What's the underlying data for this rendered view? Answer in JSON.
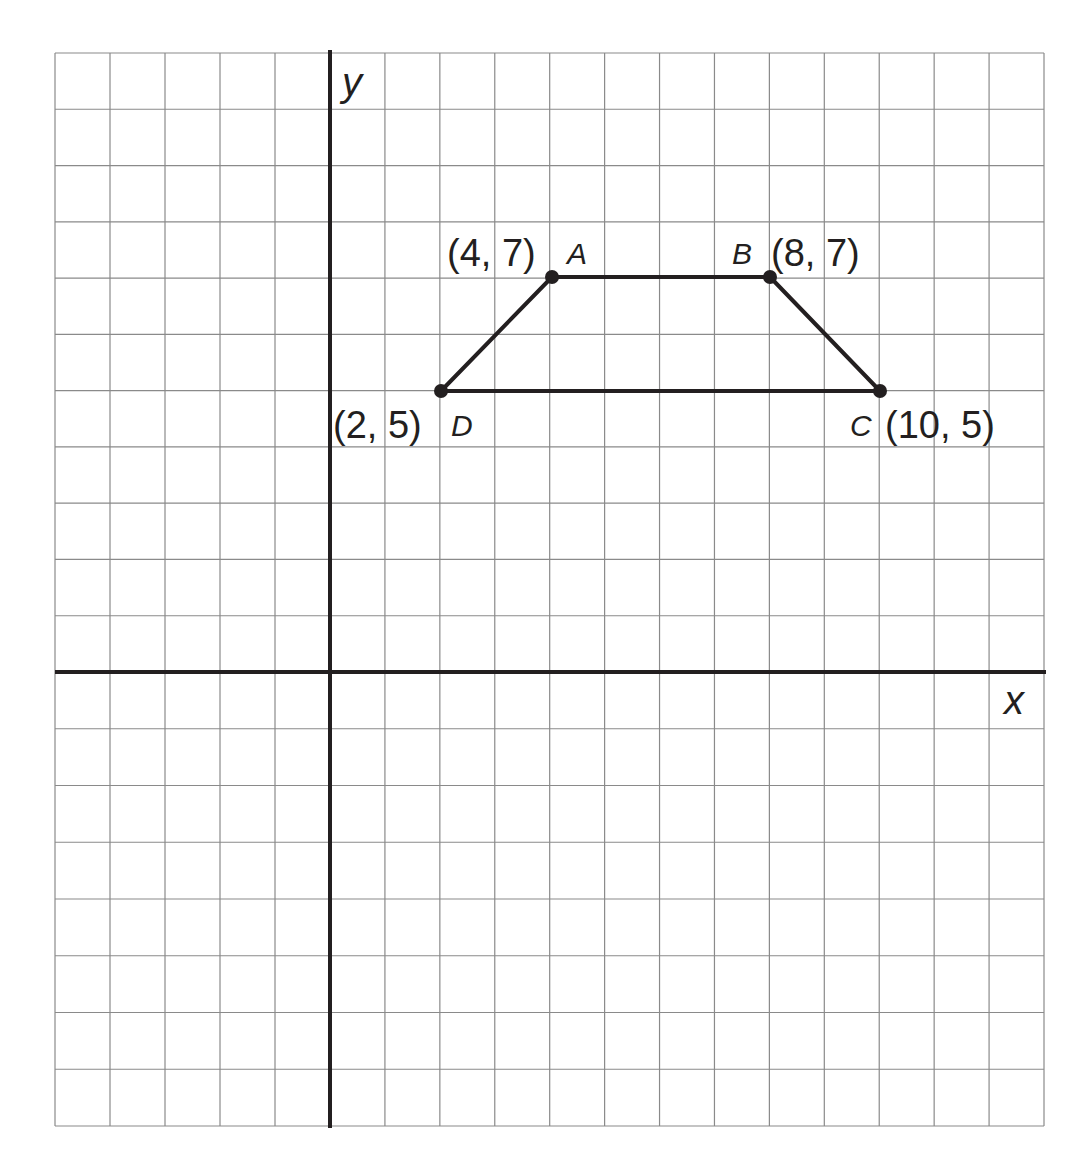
{
  "chart_data": {
    "type": "scatter",
    "title": "",
    "xlabel": "x",
    "ylabel": "y",
    "xlim": [
      -5,
      13
    ],
    "ylim": [
      -8,
      11
    ],
    "grid": true,
    "points": [
      {
        "name": "A",
        "x": 4,
        "y": 7,
        "label": "(4, 7)"
      },
      {
        "name": "B",
        "x": 8,
        "y": 7,
        "label": "(8, 7)"
      },
      {
        "name": "C",
        "x": 10,
        "y": 5,
        "label": "(10, 5)"
      },
      {
        "name": "D",
        "x": 2,
        "y": 5,
        "label": "(2, 5)"
      }
    ],
    "polygon": [
      "A",
      "B",
      "C",
      "D"
    ],
    "shape": "trapezoid ABCD"
  },
  "axes": {
    "x_label": "x",
    "y_label": "y"
  },
  "vertices": {
    "A": {
      "name": "A",
      "coord": "(4, 7)"
    },
    "B": {
      "name": "B",
      "coord": "(8, 7)"
    },
    "C": {
      "name": "C",
      "coord": "(10, 5)"
    },
    "D": {
      "name": "D",
      "coord": "(2, 5)"
    }
  },
  "colors": {
    "grid": "#8a8a8a",
    "axis": "#231f20",
    "shape": "#231f20",
    "background": "#ffffff"
  }
}
